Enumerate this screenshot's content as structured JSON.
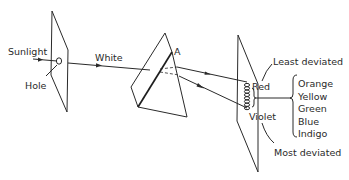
{
  "diagram": {
    "labels": {
      "sunlight": "Sunlight",
      "hole": "Hole",
      "white": "White",
      "apex": "A",
      "red": "Red",
      "violet": "Violet",
      "least_deviated": "Least deviated",
      "most_deviated": "Most deviated"
    },
    "spectrum_between": [
      "Orange",
      "Yellow",
      "Green",
      "Blue",
      "Indigo"
    ],
    "colors": {
      "line": "#2a2a2a",
      "background": "#ffffff"
    }
  }
}
